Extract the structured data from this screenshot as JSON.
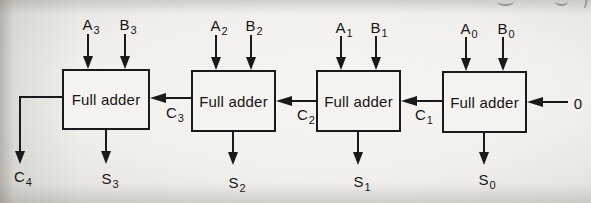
{
  "colors": {
    "paper": "#f1f0ec",
    "ink": "#1a1a1a",
    "box_fill": "#f4f3ef"
  },
  "diagram": {
    "type": "4-bit ripple-carry adder",
    "box_label": "Full adder",
    "carry_in_label": "0",
    "carry_out": {
      "base": "C",
      "sub": "4"
    },
    "stages": [
      {
        "a_base": "A",
        "a_sub": "3",
        "b_base": "B",
        "b_sub": "3",
        "sum_base": "S",
        "sum_sub": "3"
      },
      {
        "a_base": "A",
        "a_sub": "2",
        "b_base": "B",
        "b_sub": "2",
        "sum_base": "S",
        "sum_sub": "2"
      },
      {
        "a_base": "A",
        "a_sub": "1",
        "b_base": "B",
        "b_sub": "1",
        "sum_base": "S",
        "sum_sub": "1"
      },
      {
        "a_base": "A",
        "a_sub": "0",
        "b_base": "B",
        "b_sub": "0",
        "sum_base": "S",
        "sum_sub": "0"
      }
    ],
    "carries": [
      {
        "base": "C",
        "sub": "3"
      },
      {
        "base": "C",
        "sub": "2"
      },
      {
        "base": "C",
        "sub": "1"
      }
    ]
  }
}
